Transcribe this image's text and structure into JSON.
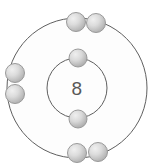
{
  "diagram": {
    "type": "bohr-atom-model",
    "background_color": "#ffffff",
    "nucleus": {
      "label": "8",
      "label_color": "#585858",
      "meaning": "atomic number 8 (oxygen)"
    },
    "shell_style": {
      "stroke_color": "#5a5a5a",
      "stroke_width": 1,
      "fill_color": "#fdfdfd"
    },
    "electron_style": {
      "fill_light": "#e6e6e6",
      "fill_dark": "#b4b4b4",
      "stroke_color": "#9b9b9b",
      "radius": 9
    },
    "center": {
      "x": 77,
      "y": 88
    },
    "shells": [
      {
        "name": "inner-shell",
        "index": 1,
        "radius": 30,
        "electron_count": 2
      },
      {
        "name": "outer-shell",
        "index": 2,
        "radius": 70,
        "electron_count": 6
      }
    ],
    "electrons": [
      {
        "name": "electron-inner-top",
        "shell": 1,
        "x": 78,
        "y": 58
      },
      {
        "name": "electron-inner-bottom",
        "shell": 1,
        "x": 78,
        "y": 119
      },
      {
        "name": "electron-outer-top-left",
        "shell": 2,
        "x": 76,
        "y": 22
      },
      {
        "name": "electron-outer-top-right",
        "shell": 2,
        "x": 96,
        "y": 23
      },
      {
        "name": "electron-outer-left-upper",
        "shell": 2,
        "x": 15,
        "y": 73
      },
      {
        "name": "electron-outer-left-lower",
        "shell": 2,
        "x": 15,
        "y": 94
      },
      {
        "name": "electron-outer-bottom-left",
        "shell": 2,
        "x": 77,
        "y": 153
      },
      {
        "name": "electron-outer-bottom-right",
        "shell": 2,
        "x": 98,
        "y": 152
      }
    ]
  }
}
